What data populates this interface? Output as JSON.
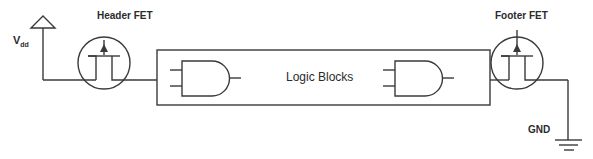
{
  "diagram": {
    "labels": {
      "vdd_main": "V",
      "vdd_sub": "dd",
      "header_fet": "Header FET",
      "logic_blocks": "Logic Blocks",
      "footer_fet": "Footer FET",
      "gnd": "GND"
    },
    "nodes": [
      {
        "id": "vdd",
        "type": "supply",
        "label": "Vdd"
      },
      {
        "id": "header_fet",
        "type": "transistor",
        "label": "Header FET"
      },
      {
        "id": "logic_blocks",
        "type": "block",
        "label": "Logic Blocks",
        "contains": [
          "and_gate_1",
          "and_gate_2"
        ]
      },
      {
        "id": "and_gate_1",
        "type": "and-gate"
      },
      {
        "id": "and_gate_2",
        "type": "and-gate"
      },
      {
        "id": "footer_fet",
        "type": "transistor",
        "label": "Footer FET"
      },
      {
        "id": "gnd",
        "type": "ground",
        "label": "GND"
      }
    ],
    "edges": [
      {
        "from": "vdd",
        "to": "header_fet"
      },
      {
        "from": "header_fet",
        "to": "logic_blocks"
      },
      {
        "from": "logic_blocks",
        "to": "footer_fet"
      },
      {
        "from": "footer_fet",
        "to": "gnd"
      }
    ],
    "colors": {
      "stroke": "#3a3a3a",
      "text": "#2b2b2b",
      "background": "#ffffff"
    }
  }
}
